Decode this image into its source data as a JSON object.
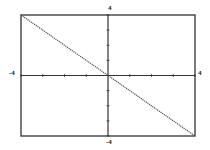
{
  "chart_data": {
    "type": "line",
    "title": "",
    "xlabel": "",
    "ylabel": "",
    "xlim": [
      -4,
      4
    ],
    "ylim": [
      -4,
      4
    ],
    "x_tick_step": 1,
    "y_tick_step": 1,
    "grid": false,
    "series": [
      {
        "name": "y = -x",
        "x": [
          -4,
          -3,
          -2,
          -1,
          0,
          1,
          2,
          3,
          4
        ],
        "y": [
          4,
          3,
          2,
          1,
          0,
          -1,
          -2,
          -3,
          -4
        ]
      }
    ],
    "annotations": {
      "y_max_label": "4",
      "y_min_label": "-4",
      "x_min_label": "-4",
      "x_max_label": "4"
    }
  },
  "labels": {
    "top": "4",
    "bottom": "-4",
    "left": "-4",
    "right": "4"
  }
}
